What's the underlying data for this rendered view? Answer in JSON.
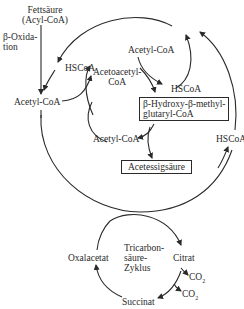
{
  "diagram": {
    "title": "",
    "nodes": {
      "fatty_acid": {
        "line1": "Fettsäure",
        "line2": "(Acyl-CoA)"
      },
      "beta_oxidation": {
        "line1": "β-Oxida-",
        "line2": "tion"
      },
      "hscoa_left": "HSCoA",
      "acetoacetyl_coa": {
        "line1": "Acetoacetyl-",
        "line2": "CoA"
      },
      "acetyl_coa_top": "Acetyl-CoA",
      "hscoa_mid": "HSCoA",
      "acetyl_coa_left": "Acetyl-CoA",
      "hmg_coa": {
        "line1": "β-Hydroxy-β-methyl-",
        "line2": "glutaryl-CoA"
      },
      "acetyl_coa_lower": "Acetyl-CoA",
      "hscoa_right": "HSCoA",
      "acetoacetic_acid": "Acetessigsäure",
      "tca_cycle": {
        "line1": "Tricarbon-",
        "line2": "säure-",
        "line3": "Zyklus"
      },
      "oxaloacetate": "Oxalacetat",
      "citrate": "Citrat",
      "co2_1": "CO",
      "co2_2": "CO",
      "co2_sub": "2",
      "succinate": "Succinat"
    },
    "colors": {
      "line": "#2a2a2a",
      "background": "#ffffff"
    }
  }
}
